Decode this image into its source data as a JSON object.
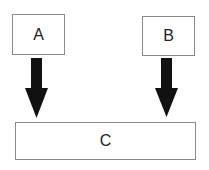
{
  "diagram": {
    "type": "flow",
    "nodes": [
      {
        "id": "A",
        "label": "A"
      },
      {
        "id": "B",
        "label": "B"
      },
      {
        "id": "C",
        "label": "C"
      }
    ],
    "edges": [
      {
        "from": "A",
        "to": "C"
      },
      {
        "from": "B",
        "to": "C"
      }
    ],
    "colors": {
      "box_border": "#8a8a8a",
      "arrow": "#111111",
      "text": "#222222",
      "background": "#ffffff"
    }
  }
}
